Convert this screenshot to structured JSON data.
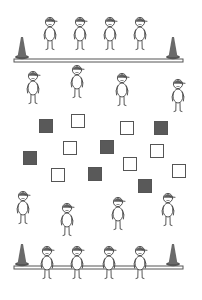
{
  "scene": {
    "description": "Illustration of children standing between two benches with cones, with scattered dark and light squares on the floor",
    "colors": {
      "stroke": "#444444",
      "bench_fill": "#ffffff",
      "bench_stroke": "#555555",
      "cone_fill": "#6a6a6a",
      "cone_base": "#555555",
      "dark_square": "#595959",
      "light_square": "#ffffff",
      "square_stroke": "#555555",
      "cap_fill": "#606060",
      "background": "#ffffff"
    },
    "counts": {
      "children": 16,
      "cones": 4,
      "benches": 2,
      "dark_squares": 6,
      "light_squares": 7
    }
  }
}
